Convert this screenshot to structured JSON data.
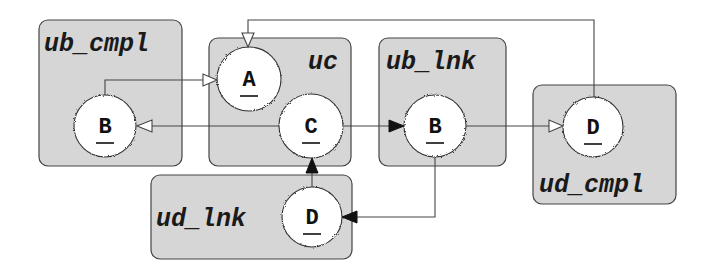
{
  "diagram": {
    "components": [
      {
        "id": "ub_cmpl",
        "label": "ub_cmpl",
        "x": 39,
        "y": 20,
        "w": 143,
        "h": 146,
        "label_x": 44,
        "label_y": 51
      },
      {
        "id": "uc",
        "label": "uc",
        "x": 209,
        "y": 38,
        "w": 142,
        "h": 128,
        "label_x": 308,
        "label_y": 69
      },
      {
        "id": "ub_lnk",
        "label": "ub_lnk",
        "x": 379,
        "y": 38,
        "w": 127,
        "h": 128,
        "label_x": 386,
        "label_y": 69
      },
      {
        "id": "ud_cmpl",
        "label": "ud_cmpl",
        "x": 533,
        "y": 85,
        "w": 143,
        "h": 119,
        "label_x": 539,
        "label_y": 192
      },
      {
        "id": "ud_lnk",
        "label": "ud_lnk",
        "x": 151,
        "y": 175,
        "w": 201,
        "h": 84,
        "label_x": 156,
        "label_y": 226
      }
    ],
    "nodes": [
      {
        "id": "ub_cmpl.B",
        "component": "ub_cmpl",
        "label": "B",
        "cx": 105,
        "cy": 126,
        "r": 31
      },
      {
        "id": "uc.A",
        "component": "uc",
        "label": "A",
        "cx": 249,
        "cy": 79,
        "r": 32
      },
      {
        "id": "uc.C",
        "component": "uc",
        "label": "C",
        "cx": 311,
        "cy": 126,
        "r": 32
      },
      {
        "id": "ub_lnk.B",
        "component": "ub_lnk",
        "label": "B",
        "cx": 435,
        "cy": 126,
        "r": 31
      },
      {
        "id": "ud_cmpl.D",
        "component": "ud_cmpl",
        "label": "D",
        "cx": 593,
        "cy": 127,
        "r": 30
      },
      {
        "id": "ud_lnk.D",
        "component": "ud_lnk",
        "label": "D",
        "cx": 312,
        "cy": 217,
        "r": 30
      }
    ],
    "edges": [
      {
        "from": "ub_cmpl.B",
        "to": "uc.A",
        "arrow": "open"
      },
      {
        "from": "uc.C",
        "to": "ub_cmpl.B",
        "arrow": "open"
      },
      {
        "from": "uc.C",
        "to": "ub_lnk.B",
        "arrow": "filled"
      },
      {
        "from": "ub_lnk.B",
        "to": "ud_cmpl.D",
        "arrow": "open"
      },
      {
        "from": "ud_cmpl.D",
        "to": "uc.A",
        "arrow": "open"
      },
      {
        "from": "ub_lnk.B",
        "to": "ud_lnk.D",
        "arrow": "filled"
      },
      {
        "from": "ud_lnk.D",
        "to": "uc.C",
        "arrow": "filled"
      }
    ],
    "colors": {
      "component_fill": "#d6d6d6",
      "node_fill": "#ffffff",
      "stroke": "#444444"
    }
  }
}
